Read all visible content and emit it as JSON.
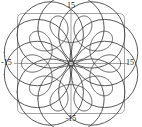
{
  "figure": {
    "title": "",
    "frame_color": "#9a9a9a",
    "axis_color": "#8d8d8d",
    "curve_color": "#3c3c3c",
    "background": "#ffffff"
  },
  "axes": {
    "top_label": "15",
    "bottom_label": "-15",
    "left_label": "-15",
    "right_label": "15"
  },
  "chart_data": {
    "type": "line",
    "title": "",
    "xlabel": "",
    "ylabel": "",
    "xlim": [
      -15,
      15
    ],
    "ylim": [
      -15,
      15
    ],
    "xticks": [
      -15,
      15
    ],
    "yticks": [
      -15,
      15
    ],
    "xticklabels": [
      "-15",
      "15"
    ],
    "yticklabels": [
      "-15",
      "15"
    ],
    "grid": false,
    "legend": null,
    "axes_style": "centered-cross-with-rounded-box-frame",
    "parametric": {
      "x_expression": "9*cos(t) + 4*cos(9*t/4)",
      "y_expression": "9*sin(t) - 4*sin(9*t/4)",
      "t_range": [
        0,
        25.1327
      ],
      "lobes": 10,
      "outer_radius": 13,
      "inner_loop_radius": 5
    },
    "series": [
      {
        "name": "trochoid",
        "x": [
          13.0,
          12.28,
          10.26,
          7.29,
          3.87,
          0.62,
          -1.94,
          -3.43,
          -3.69,
          -2.77,
          -0.95,
          1.31,
          3.44,
          4.94,
          5.48,
          4.96,
          3.52,
          1.52,
          -0.55,
          -2.21,
          -3.12,
          -3.14,
          -2.33,
          -0.93,
          0.71,
          2.2,
          3.2,
          3.52,
          3.14,
          2.2,
          0.96,
          -0.26,
          -1.15,
          -1.5,
          -1.24,
          -0.47,
          0.59,
          1.63,
          2.36,
          2.58,
          2.22,
          1.36,
          0.2,
          -0.94,
          -1.76,
          -2.05,
          -1.72,
          -0.85,
          0.35,
          1.58,
          2.49,
          2.85,
          2.55,
          1.67,
          0.43,
          -0.84,
          -1.8,
          -2.21,
          -1.98,
          -1.18,
          0.0,
          1.18,
          1.98,
          2.21,
          1.8,
          0.84,
          -0.43,
          -1.67,
          -2.55,
          -2.85,
          -2.49,
          -1.58,
          -0.35,
          0.85,
          1.72,
          2.05,
          1.76,
          0.94,
          -0.2,
          -1.36,
          -2.22,
          -2.58,
          -2.36,
          -1.63,
          -0.59,
          0.47,
          1.24,
          1.5,
          1.15,
          0.26,
          -0.96,
          -2.2,
          -3.14,
          -3.52,
          -3.2,
          -2.2,
          -0.71,
          0.93,
          2.33,
          3.14,
          3.12,
          2.21,
          0.55,
          -1.52,
          -3.52,
          -4.96,
          -5.48,
          -4.94,
          -3.44,
          -1.31,
          0.95,
          2.77,
          3.69,
          3.43,
          1.94,
          -0.62,
          -3.87,
          -7.29,
          -10.26,
          -12.28,
          -13.0
        ],
        "y": [
          0.0,
          2.07,
          4.76,
          7.44,
          9.53,
          10.64,
          10.68,
          9.79,
          8.26,
          6.47,
          4.77,
          3.45,
          2.66,
          2.43,
          2.67,
          3.2,
          3.81,
          4.31,
          4.53,
          4.41,
          3.94,
          3.2,
          2.33,
          1.5,
          0.89,
          0.62,
          0.74,
          1.2,
          1.92,
          2.76,
          3.58,
          4.23,
          4.58,
          4.57,
          4.19,
          3.51,
          2.63,
          1.71,
          0.9,
          0.32,
          0.08,
          0.2,
          0.65,
          1.35,
          2.19,
          3.03,
          3.74,
          4.2,
          4.33,
          4.09,
          3.53,
          2.73,
          1.84,
          1.01,
          0.39,
          0.11,
          0.22,
          0.7,
          1.47,
          2.4,
          3.36,
          2.4,
          1.47,
          0.7,
          0.22,
          0.11,
          0.39,
          1.01,
          1.84,
          2.73,
          3.53,
          4.09,
          4.33,
          4.2,
          3.74,
          3.03,
          2.19,
          1.35,
          0.65,
          0.2,
          0.08,
          0.32,
          0.9,
          1.71,
          2.63,
          3.51,
          4.19,
          4.57,
          4.58,
          4.23,
          3.58,
          2.76,
          1.92,
          1.2,
          0.74,
          0.62,
          0.89,
          1.5,
          2.33,
          3.2,
          3.94,
          4.41,
          4.53,
          4.31,
          3.81,
          3.2,
          2.67,
          2.43,
          2.66,
          3.45,
          4.77,
          6.47,
          8.26,
          9.79,
          10.68,
          10.64,
          9.53,
          7.44,
          4.76,
          2.07,
          0.0
        ]
      }
    ]
  }
}
